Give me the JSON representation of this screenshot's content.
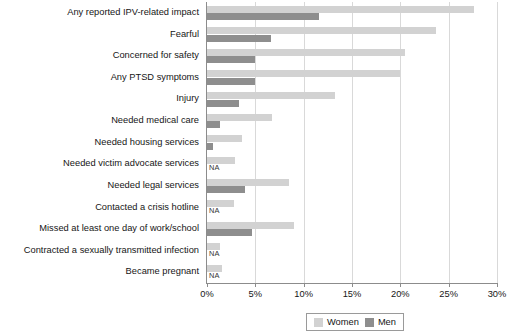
{
  "chart_data": {
    "type": "bar",
    "orientation": "horizontal",
    "title": "",
    "subtitle": "",
    "xlabel": "",
    "ylabel": "",
    "xlim": [
      0,
      30
    ],
    "xunit": "%",
    "grid": true,
    "legend_position": "bottom-right",
    "xticks": [
      {
        "value": 0,
        "label": "0%"
      },
      {
        "value": 5,
        "label": "5%"
      },
      {
        "value": 10,
        "label": "10%"
      },
      {
        "value": 15,
        "label": "15%"
      },
      {
        "value": 20,
        "label": "20%"
      },
      {
        "value": 25,
        "label": "25%"
      },
      {
        "value": 30,
        "label": "30%"
      }
    ],
    "categories": [
      "Any reported IPV-related impact",
      "Fearful",
      "Concerned for safety",
      "Any PTSD symptoms",
      "Injury",
      "Needed medical care",
      "Needed housing services",
      "Needed victim advocate services",
      "Needed legal services",
      "Contacted a crisis hotline",
      "Missed at least one day of work/school",
      "Contracted a sexually transmitted infection",
      "Became pregnant"
    ],
    "series": [
      {
        "name": "Women",
        "color": "#d2d2d2",
        "values": [
          27.6,
          23.7,
          20.5,
          20.0,
          13.2,
          6.7,
          3.6,
          2.9,
          8.5,
          2.8,
          9.0,
          1.3,
          1.6
        ]
      },
      {
        "name": "Men",
        "color": "#8e8e8e",
        "values": [
          11.6,
          6.6,
          5.0,
          5.0,
          3.3,
          1.3,
          0.6,
          null,
          3.9,
          null,
          4.7,
          null,
          null
        ]
      }
    ],
    "na_label": "NA",
    "annotations": [
      {
        "category": "Needed victim advocate services",
        "series": "Men",
        "text": "NA"
      },
      {
        "category": "Contacted a crisis hotline",
        "series": "Men",
        "text": "NA"
      },
      {
        "category": "Contracted a sexually transmitted infection",
        "series": "Men",
        "text": "NA"
      },
      {
        "category": "Became pregnant",
        "series": "Men",
        "text": "NA"
      }
    ]
  },
  "legend": {
    "items": [
      {
        "label": "Women",
        "color": "#d2d2d2"
      },
      {
        "label": "Men",
        "color": "#8e8e8e"
      }
    ]
  }
}
